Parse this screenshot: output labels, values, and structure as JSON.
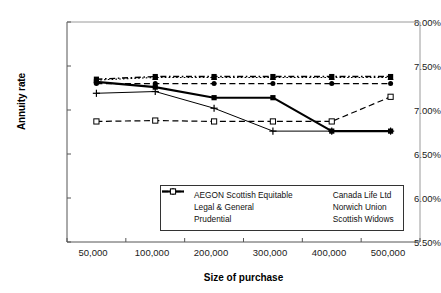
{
  "chart_data": {
    "type": "line",
    "title": "",
    "xlabel": "Size of purchase",
    "ylabel": "Annuity rate",
    "categories": [
      "50,000",
      "100,000",
      "200,000",
      "300,000",
      "400,000",
      "500,000"
    ],
    "x_values": [
      50000,
      100000,
      200000,
      300000,
      400000,
      500000
    ],
    "ylim": [
      5.5,
      8.0
    ],
    "y_ticks": [
      "5.50%",
      "6.00%",
      "6.50%",
      "7.00%",
      "7.50%",
      "8.00%"
    ],
    "y_tick_values": [
      5.5,
      6.0,
      6.5,
      7.0,
      7.5,
      8.0
    ],
    "y_unit": "%",
    "grid": false,
    "legend_position": "inside-bottom-center",
    "series": [
      {
        "name": "AEGON Scottish Equitable",
        "values": [
          7.35,
          7.38,
          7.38,
          7.38,
          7.38,
          7.38
        ],
        "marker": "filled-square",
        "line_style": "dash-dot",
        "line_width": 1.4,
        "color": "#000000"
      },
      {
        "name": "Canada Life Ltd",
        "values": [
          7.34,
          7.37,
          7.37,
          7.37,
          7.37,
          7.37
        ],
        "marker": "triangle",
        "line_style": "dotted",
        "line_width": 1.1,
        "color": "#000000"
      },
      {
        "name": "Legal & General",
        "values": [
          7.32,
          7.26,
          7.14,
          7.14,
          6.76,
          6.76
        ],
        "marker": "filled-square",
        "line_style": "solid",
        "line_width": 2.1,
        "color": "#000000"
      },
      {
        "name": "Norwich Union",
        "values": [
          7.3,
          7.3,
          7.3,
          7.3,
          7.3,
          7.3
        ],
        "marker": "filled-circle",
        "line_style": "dashed",
        "line_width": 1.1,
        "color": "#000000"
      },
      {
        "name": "Prudential",
        "values": [
          7.19,
          7.21,
          7.02,
          6.76,
          6.76,
          6.76
        ],
        "marker": "plus",
        "line_style": "solid",
        "line_width": 1.0,
        "color": "#000000"
      },
      {
        "name": "Scottish Widows",
        "values": [
          6.87,
          6.88,
          6.87,
          6.87,
          6.87,
          7.15
        ],
        "marker": "open-square",
        "line_style": "dashed",
        "line_width": 1.2,
        "color": "#000000"
      }
    ],
    "legend_order": [
      "AEGON Scottish Equitable",
      "Canada Life Ltd",
      "Legal & General",
      "Norwich Union",
      "Prudential",
      "Scottish Widows"
    ]
  }
}
